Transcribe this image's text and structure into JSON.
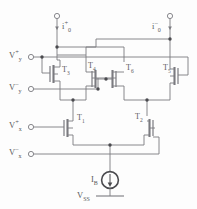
{
  "diagram": {
    "stroke_color": "#7b7b80",
    "node_color": "#4a4a4e",
    "background": "#fdfdfd",
    "terminals": {
      "current_out_pos": {
        "label_i": "i",
        "label_sub": "0",
        "label_sup": "+"
      },
      "current_out_neg": {
        "label_i": "i",
        "label_sub": "0",
        "label_sup": "–"
      },
      "vy_pos": {
        "v": "V",
        "sub": "y",
        "sup": "+"
      },
      "vy_neg": {
        "v": "V",
        "sub": "y",
        "sup": "–"
      },
      "vx_pos": {
        "v": "V",
        "sub": "x",
        "sup": "+"
      },
      "vx_neg": {
        "v": "V",
        "sub": "x",
        "sup": "–"
      }
    },
    "transistors": [
      {
        "name": "T",
        "sub": "3"
      },
      {
        "name": "T",
        "sub": "4"
      },
      {
        "name": "T",
        "sub": "6"
      },
      {
        "name": "T",
        "sub": "5"
      },
      {
        "name": "T",
        "sub": "1"
      },
      {
        "name": "T",
        "sub": "2"
      }
    ],
    "current_source": {
      "name": "I",
      "sub": "B"
    },
    "supply": {
      "name": "V",
      "sub": "SS"
    }
  }
}
